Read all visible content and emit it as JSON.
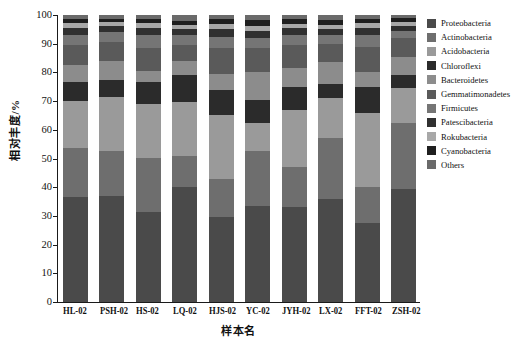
{
  "chart_data": {
    "type": "bar",
    "subtype": "stacked-bar-100-percent",
    "title": "",
    "xlabel": "样本名",
    "ylabel": "相对丰度/%",
    "ylim": [
      0,
      100
    ],
    "yticks": [
      0,
      10,
      20,
      30,
      40,
      50,
      60,
      70,
      80,
      90,
      100
    ],
    "grid": false,
    "legend_position": "right",
    "categories": [
      "HL-02",
      "PSH-02",
      "HS-02",
      "LQ-02",
      "HJS-02",
      "YC-02",
      "JYH-02",
      "LX-02",
      "FFT-02",
      "ZSH-02"
    ],
    "series": [
      {
        "name": "Proteobacteria",
        "color": "#4a4a4a",
        "values": [
          36.5,
          37.0,
          31.5,
          40.0,
          29.5,
          33.5,
          33.0,
          36.0,
          27.5,
          39.5
        ]
      },
      {
        "name": "Actinobacteria",
        "color": "#6e6e6e",
        "values": [
          17.0,
          15.5,
          18.5,
          11.0,
          13.5,
          19.0,
          14.0,
          21.0,
          12.5,
          23.0
        ]
      },
      {
        "name": "Acidobacteria",
        "color": "#9a9a9a",
        "values": [
          16.5,
          19.0,
          19.0,
          18.5,
          22.0,
          10.0,
          20.0,
          14.0,
          26.0,
          12.0
        ]
      },
      {
        "name": "Chloroflexi",
        "color": "#2b2b2b",
        "values": [
          6.5,
          6.0,
          7.5,
          9.5,
          9.0,
          8.0,
          8.0,
          5.0,
          9.0,
          4.5
        ]
      },
      {
        "name": "Bacteroidetes",
        "color": "#8c8c8c",
        "values": [
          6.0,
          6.5,
          4.0,
          5.0,
          5.5,
          9.5,
          6.5,
          7.5,
          5.0,
          6.5
        ]
      },
      {
        "name": "Gemmatimonadetes",
        "color": "#5a5a5a",
        "values": [
          7.0,
          6.5,
          8.0,
          5.5,
          9.0,
          8.5,
          8.0,
          6.5,
          9.0,
          6.5
        ]
      },
      {
        "name": "Firmicutes",
        "color": "#757575",
        "values": [
          3.5,
          3.5,
          4.5,
          3.5,
          4.0,
          3.5,
          3.5,
          3.0,
          4.0,
          2.5
        ]
      },
      {
        "name": "Patescibacteria",
        "color": "#303030",
        "values": [
          2.5,
          2.0,
          2.5,
          2.0,
          2.5,
          2.5,
          2.5,
          2.0,
          2.5,
          1.8
        ]
      },
      {
        "name": "Rokubacteria",
        "color": "#a8a8a8",
        "values": [
          1.8,
          1.5,
          1.8,
          1.5,
          1.8,
          1.8,
          1.5,
          1.5,
          1.8,
          1.2
        ]
      },
      {
        "name": "Cyanobacteria",
        "color": "#1f1f1f",
        "values": [
          1.2,
          1.0,
          1.2,
          1.5,
          1.7,
          2.0,
          1.5,
          1.8,
          1.2,
          1.3
        ]
      },
      {
        "name": "Others",
        "color": "#6a6a6a",
        "values": [
          1.5,
          1.5,
          1.5,
          2.0,
          1.5,
          1.7,
          1.5,
          1.7,
          1.5,
          1.2
        ]
      }
    ]
  },
  "legend": {
    "items": [
      {
        "label": "Proteobacteria",
        "color": "#4a4a4a"
      },
      {
        "label": "Actinobacteria",
        "color": "#6e6e6e"
      },
      {
        "label": "Acidobacteria",
        "color": "#9a9a9a"
      },
      {
        "label": "Chloroflexi",
        "color": "#2b2b2b"
      },
      {
        "label": "Bacteroidetes",
        "color": "#8c8c8c"
      },
      {
        "label": "Gemmatimonadetes",
        "color": "#5a5a5a"
      },
      {
        "label": "Firmicutes",
        "color": "#757575"
      },
      {
        "label": "Patescibacteria",
        "color": "#303030"
      },
      {
        "label": "Rokubacteria",
        "color": "#a8a8a8"
      },
      {
        "label": "Cyanobacteria",
        "color": "#1f1f1f"
      },
      {
        "label": "Others",
        "color": "#6a6a6a"
      }
    ]
  }
}
